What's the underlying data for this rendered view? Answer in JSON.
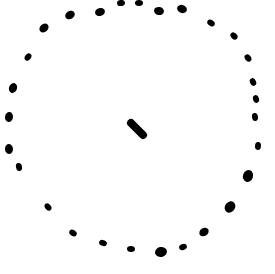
{
  "drawing": {
    "width": 275,
    "height": 274,
    "background": "#ffffff",
    "ink": "#000000",
    "description": "hand-drawn dotted circle with a short dash at the center",
    "ring_dots": [
      {
        "x": 44,
        "y": 28,
        "r": 5
      },
      {
        "x": 70,
        "y": 15,
        "r": 5
      },
      {
        "x": 100,
        "y": 12,
        "r": 5
      },
      {
        "x": 121,
        "y": 3,
        "r": 4
      },
      {
        "x": 139,
        "y": 3,
        "r": 4
      },
      {
        "x": 159,
        "y": 11,
        "r": 5
      },
      {
        "x": 182,
        "y": 9,
        "r": 5
      },
      {
        "x": 211,
        "y": 23,
        "r": 4
      },
      {
        "x": 234,
        "y": 36,
        "r": 4
      },
      {
        "x": 248,
        "y": 58,
        "r": 4
      },
      {
        "x": 253,
        "y": 82,
        "r": 4
      },
      {
        "x": 256,
        "y": 99,
        "r": 4
      },
      {
        "x": 255,
        "y": 117,
        "r": 4
      },
      {
        "x": 258,
        "y": 146,
        "r": 4
      },
      {
        "x": 248,
        "y": 176,
        "r": 6
      },
      {
        "x": 230,
        "y": 207,
        "r": 6
      },
      {
        "x": 204,
        "y": 232,
        "r": 5
      },
      {
        "x": 183,
        "y": 247,
        "r": 4
      },
      {
        "x": 161,
        "y": 252,
        "r": 6
      },
      {
        "x": 131,
        "y": 249,
        "r": 4
      },
      {
        "x": 103,
        "y": 243,
        "r": 4
      },
      {
        "x": 73,
        "y": 233,
        "r": 4
      },
      {
        "x": 48,
        "y": 207,
        "r": 4
      },
      {
        "x": 19,
        "y": 167,
        "r": 4
      },
      {
        "x": 9,
        "y": 149,
        "r": 5
      },
      {
        "x": 9,
        "y": 117,
        "r": 5
      },
      {
        "x": 13,
        "y": 88,
        "r": 5
      },
      {
        "x": 28,
        "y": 57,
        "r": 4
      }
    ],
    "center_dash": {
      "x1": 131,
      "y1": 123,
      "x2": 143,
      "y2": 135,
      "width": 8
    }
  }
}
